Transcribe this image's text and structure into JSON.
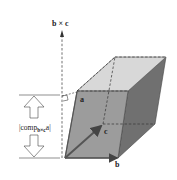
{
  "diagram": {
    "labels": {
      "normal_vector": "b × c",
      "vector_a": "a",
      "vector_b": "b",
      "vector_c": "c",
      "height_prefix": "|comp",
      "height_sub": "b×c",
      "height_suffix": "a|"
    },
    "colors": {
      "front_face": "#9a9a9a",
      "top_face": "#d6d6d6",
      "side_face": "#6f6f6f",
      "edges": "#333333",
      "arrow": "#555555",
      "background": "#ffffff"
    }
  }
}
